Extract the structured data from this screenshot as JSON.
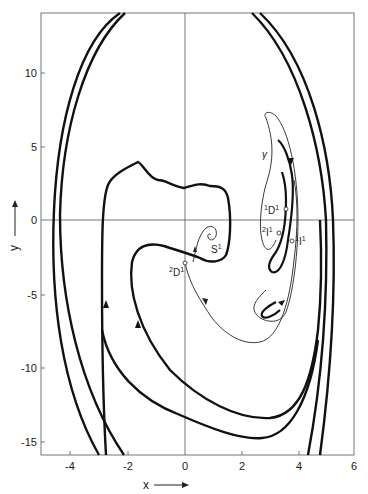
{
  "figure": {
    "x_axis": {
      "label": "x",
      "arrow": "right-arrow",
      "ticks": [
        "-4",
        "-2",
        "0",
        "2",
        "4",
        "6"
      ],
      "range": [
        -5,
        6
      ]
    },
    "y_axis": {
      "label": "y",
      "arrow": "up-arrow",
      "ticks": [
        "10",
        "5",
        "0",
        "-5",
        "-10",
        "-15"
      ],
      "range": [
        -16,
        14
      ]
    },
    "points": [
      {
        "id": "1D1",
        "pre": "1",
        "main": "D",
        "post": "1"
      },
      {
        "id": "2I1",
        "pre": "2",
        "main": "I",
        "post": "1"
      },
      {
        "id": "1I1",
        "pre": "1",
        "main": "I",
        "post": "1"
      },
      {
        "id": "2D1",
        "pre": "2",
        "main": "D",
        "post": "1"
      },
      {
        "id": "S1",
        "pre": "",
        "main": "S",
        "post": "1"
      }
    ],
    "annotations": {
      "gamma": "γ"
    },
    "colors": {
      "curve": "#111111",
      "axis": "#555555",
      "text": "#222222"
    }
  }
}
